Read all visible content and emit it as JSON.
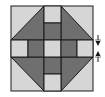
{
  "diagram": {
    "type": "quilt-block",
    "colors": {
      "light": "#d6d6d6",
      "dark": "#6f6f6f",
      "outline": "#1a1a1a",
      "background": "#ffffff"
    },
    "arrows": {
      "upper": "down-arrow",
      "lower": "up-arrow"
    }
  }
}
